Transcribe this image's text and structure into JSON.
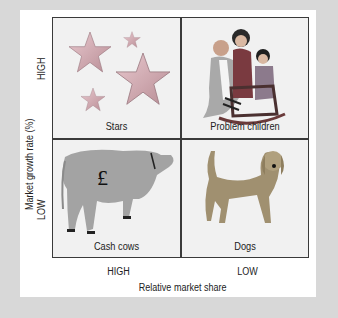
{
  "diagram": {
    "type": "BCG growth-share matrix",
    "y_axis": {
      "title": "Market growth rate (%)",
      "high": "HIGH",
      "low": "LOW"
    },
    "x_axis": {
      "title": "Relative market share",
      "high": "HIGH",
      "low": "LOW"
    },
    "quadrants": [
      {
        "position": "top-left",
        "label": "Stars",
        "illustration": "star-icon"
      },
      {
        "position": "top-right",
        "label": "Problem children",
        "illustration": "family-icon"
      },
      {
        "position": "bottom-left",
        "label": "Cash cows",
        "illustration": "cow-icon",
        "symbol": "£"
      },
      {
        "position": "bottom-right",
        "label": "Dogs",
        "illustration": "dog-icon"
      }
    ]
  },
  "colors": {
    "background": "#d8d8d8",
    "card": "#ffffff",
    "cell": "#f1f1f1",
    "grid_line": "#3a3a3a"
  }
}
